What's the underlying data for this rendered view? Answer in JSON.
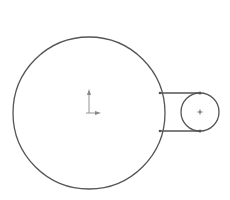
{
  "sketch": {
    "background": "#ffffff",
    "stroke_color": "#555555",
    "axis_color": "#777777",
    "large_circle": {
      "cx": 89,
      "cy": 113,
      "r": 76
    },
    "small_circle": {
      "cx": 200,
      "cy": 112,
      "r": 19
    },
    "tangent_lines": [
      {
        "x1": 160,
        "y1": 93,
        "x2": 200,
        "y2": 93
      },
      {
        "x1": 160,
        "y1": 131,
        "x2": 200,
        "y2": 131
      }
    ],
    "origin": {
      "x": 89,
      "y": 113,
      "icon": "origin-axes-icon"
    },
    "center_mark": {
      "x": 200,
      "y": 112,
      "icon": "center-point-icon"
    }
  }
}
